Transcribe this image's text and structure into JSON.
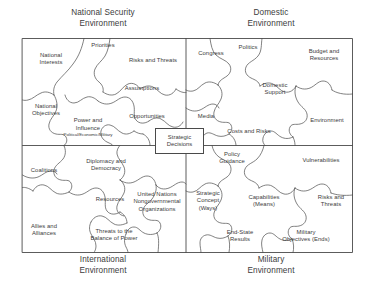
{
  "titles": {
    "national_security": "National Security\nEnvironment",
    "domestic": "Domestic\nEnvironment",
    "international": "International\nEnvironment",
    "military": "Military\nEnvironment"
  },
  "center": {
    "label": "Strategic\nDecisions"
  },
  "colors": {
    "line": "#4a4a4a",
    "text": "#3c3c3c",
    "background": "#ffffff"
  },
  "quadrants": [
    {
      "name": "national-security-environment",
      "title": "National Security\nEnvironment",
      "pieces": [
        {
          "label": "National\nInterests"
        },
        {
          "label": "Priorities"
        },
        {
          "label": "Risks and Threats"
        },
        {
          "label": "National\nObjectives"
        },
        {
          "label": "Assumptions"
        },
        {
          "label": "Power and\nInfluence",
          "sub": "Political/Economic/Military"
        },
        {
          "label": "Opportunities"
        }
      ]
    },
    {
      "name": "domestic-environment",
      "title": "Domestic\nEnvironment",
      "pieces": [
        {
          "label": "Congress"
        },
        {
          "label": "Politics"
        },
        {
          "label": "Budget and\nResources"
        },
        {
          "label": "Domestic\nSupport"
        },
        {
          "label": "Media"
        },
        {
          "label": "Costs and Risks"
        },
        {
          "label": "Environment"
        }
      ]
    },
    {
      "name": "international-environment",
      "title": "International\nEnvironment",
      "pieces": [
        {
          "label": "Coalitions"
        },
        {
          "label": "Diplomacy and\nDemocracy"
        },
        {
          "label": "Resources"
        },
        {
          "label": "United Nations\nNongovernmental\nOrganizations"
        },
        {
          "label": "Allies and\nAlliances"
        },
        {
          "label": "Threats to the\nBalance of Power"
        }
      ]
    },
    {
      "name": "military-environment",
      "title": "Military\nEnvironment",
      "pieces": [
        {
          "label": "Policy\nGuidance"
        },
        {
          "label": "Vulnerabilities"
        },
        {
          "label": "Strategic\nConcept\n(Ways)"
        },
        {
          "label": "Capabilities\n(Means)"
        },
        {
          "label": "Risks and\nThreats"
        },
        {
          "label": "End-State\nResults"
        },
        {
          "label": "Military\nObjectives (Ends)"
        }
      ]
    }
  ]
}
